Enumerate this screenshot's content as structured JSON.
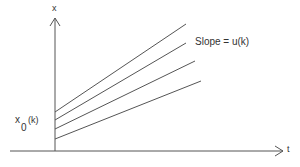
{
  "diagram": {
    "axes": {
      "vertical_label": "x",
      "horizontal_label": "t"
    },
    "annotations": {
      "slope_label": "Slope = u(k)",
      "intercept_label_main": "x",
      "intercept_label_sub": "0",
      "intercept_label_arg": "(k)"
    },
    "lines": [
      {
        "x1": 55,
        "y1": 112,
        "x2": 186,
        "y2": 24
      },
      {
        "x1": 55,
        "y1": 120,
        "x2": 186,
        "y2": 43
      },
      {
        "x1": 55,
        "y1": 129,
        "x2": 195,
        "y2": 61
      },
      {
        "x1": 55,
        "y1": 139,
        "x2": 201,
        "y2": 81
      }
    ],
    "colors": {
      "stroke": "#555555",
      "background": "#ffffff"
    }
  }
}
